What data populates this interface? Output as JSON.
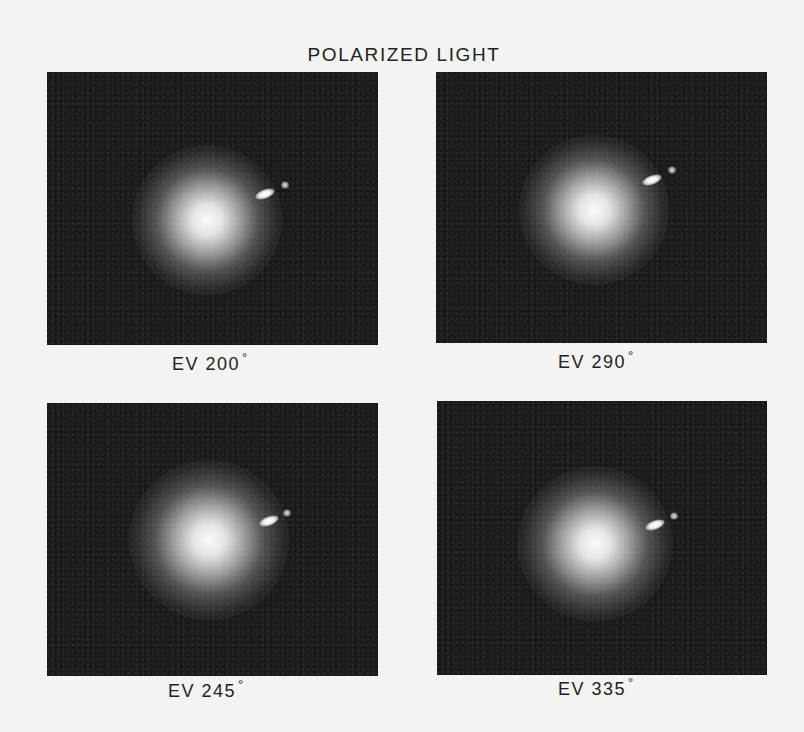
{
  "figure": {
    "title": "POLARIZED LIGHT",
    "background_color": "#f3f3f1",
    "panel_color": "#1b1b1b",
    "panels": [
      {
        "position": "top-left",
        "label_prefix": "EV",
        "angle": "200",
        "degree_symbol": "°",
        "image_description": "comet coma with bright elongated nucleus jet to the upper right"
      },
      {
        "position": "top-right",
        "label_prefix": "EV",
        "angle": "290",
        "degree_symbol": "°",
        "image_description": "comet coma with bright elongated nucleus jet to the upper right"
      },
      {
        "position": "bottom-left",
        "label_prefix": "EV",
        "angle": "245",
        "degree_symbol": "°",
        "image_description": "comet coma with bright elongated nucleus jet to the upper right"
      },
      {
        "position": "bottom-right",
        "label_prefix": "EV",
        "angle": "335",
        "degree_symbol": "°",
        "image_description": "comet coma with bright elongated nucleus jet to the upper right"
      }
    ]
  }
}
